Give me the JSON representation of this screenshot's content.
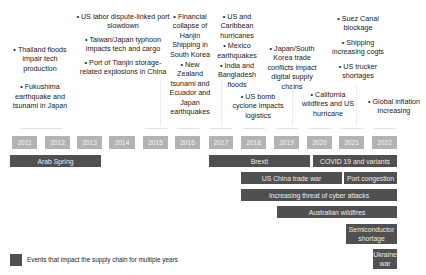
{
  "years": [
    "2011",
    "2012",
    "2013",
    "2014",
    "2015",
    "2016",
    "2017",
    "2018",
    "2019",
    "2020",
    "2021",
    "2022"
  ],
  "events": {
    "e2011": [
      "Thailand floods impair tech production",
      "Fukushima earthquake and tsunami in Japan"
    ],
    "e2015": [
      "US labor dispute-linked port slowdown",
      "Taiwan/Japan typhoon impacts tech and cargo",
      "Port of Tianjin storage-related explosions in China"
    ],
    "e2016": [
      "Financial collapse of Hanjin Shipping in South Korea",
      "New Zealand tsunami and Ecuador and Japan earthquakes"
    ],
    "e2017": [
      "US and Caribbean hurricanes",
      "Mexico earthquakes",
      "India and Bangladesh floods"
    ],
    "e2018": [
      "US bomb cyclone impacts logistics"
    ],
    "e2019": [
      "Japan/South Korea trade conflicts impact digital supply chains"
    ],
    "e2020": [
      "California wildfires and US hurricane"
    ],
    "e2021": [
      "Suez Canal blockage",
      "Shipping increasing cogts",
      "US trucker shortages"
    ],
    "e2022": [
      "Global inflation increasing"
    ]
  },
  "multi_year_events": [
    {
      "label": "Arab Spring",
      "start": "2011",
      "end": "2013"
    },
    {
      "label": "Brexit",
      "start": "2017",
      "end": "2019"
    },
    {
      "label": "COVID 19 and variants",
      "start": "2020",
      "end": "2022"
    },
    {
      "label": "US China trade war",
      "start": "2018",
      "end": "2020"
    },
    {
      "label": "Port congestion",
      "start": "2021",
      "end": "2022"
    },
    {
      "label": "Increasing threat of cyber attacks",
      "start": "2018",
      "end": "2022"
    },
    {
      "label": "Australian wildfires",
      "start": "2019",
      "end": "2022"
    },
    {
      "label": "Semiconductor shortage",
      "start": "2021",
      "end": "2022"
    },
    {
      "label": "Ukraine war",
      "start": "2022",
      "end": "2022"
    }
  ],
  "legend": {
    "label": "Events that impact the supply chain for multiple years",
    "color": "#505050"
  },
  "colors": {
    "year_box": "#b3b3b3",
    "bar": "#505050"
  }
}
